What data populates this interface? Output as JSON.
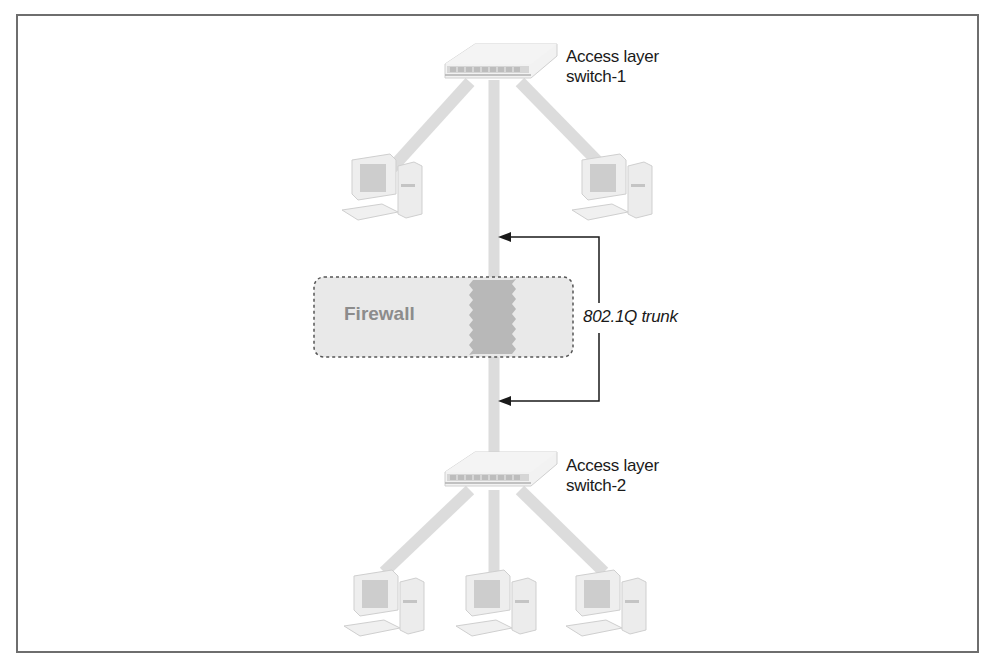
{
  "diagram": {
    "type": "network-topology",
    "nodes": {
      "switch_1": {
        "label_line1": "Access layer",
        "label_line2": "switch-1"
      },
      "switch_2": {
        "label_line1": "Access layer",
        "label_line2": "switch-2"
      },
      "firewall": {
        "label": "Firewall"
      },
      "pcs_top": 2,
      "pcs_bottom": 3
    },
    "trunk": {
      "label": "802.1Q trunk"
    },
    "colors": {
      "frame": "#6e6e6e",
      "link": "#dcdcdc",
      "firewall_fill": "#e9e9e9",
      "firewall_border": "#555555",
      "firewall_crossing": "#b5b5b5",
      "arrow": "#1a1a1a"
    }
  }
}
